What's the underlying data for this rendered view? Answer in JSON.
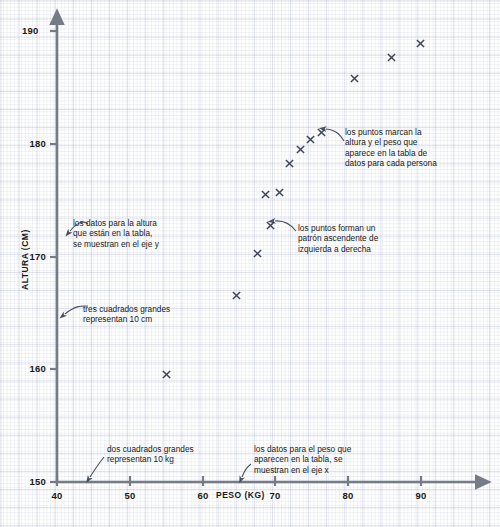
{
  "chart_data": {
    "type": "scatter",
    "title": "",
    "xlabel": "PESO (KG)",
    "ylabel": "ALTURA (CM)",
    "xlim": [
      40,
      92
    ],
    "ylim": [
      150,
      191
    ],
    "xticks": [
      40,
      50,
      60,
      70,
      80,
      90
    ],
    "yticks": [
      150,
      160,
      170,
      180,
      190
    ],
    "grid": true,
    "grid_minor_per_major": 5,
    "legend": "none",
    "marker": "x",
    "marker_color": "#3c4456",
    "points": [
      {
        "x": 55.0,
        "y": 160.0
      },
      {
        "x": 64.7,
        "y": 167.0
      },
      {
        "x": 67.6,
        "y": 170.7
      },
      {
        "x": 69.3,
        "y": 173.2
      },
      {
        "x": 68.6,
        "y": 175.9
      },
      {
        "x": 70.6,
        "y": 176.1
      },
      {
        "x": 72.0,
        "y": 178.7
      },
      {
        "x": 73.4,
        "y": 179.9
      },
      {
        "x": 74.8,
        "y": 180.8
      },
      {
        "x": 76.4,
        "y": 181.4
      },
      {
        "x": 80.9,
        "y": 186.2
      },
      {
        "x": 86.0,
        "y": 188.1
      },
      {
        "x": 89.9,
        "y": 189.3
      }
    ],
    "annotations": [
      {
        "id": "y-axis-note",
        "text": "los datos para la altura\nque están en la tabla,\nse muestran en el eje y"
      },
      {
        "id": "y-scale-note",
        "text": "tres cuadrados grandes\nrepresentan 10 cm"
      },
      {
        "id": "x-scale-note",
        "text": "dos cuadrados grandes\nrepresentan 10 kg"
      },
      {
        "id": "x-axis-note",
        "text": "los datos para el peso que\naparecen en la tabla, se\nmuestran en el eje x"
      },
      {
        "id": "points-note",
        "text": "los puntos marcan la\naltura y el peso que\naparece en la tabla de\ndatos para cada persona"
      },
      {
        "id": "trend-note",
        "text": "los puntos forman un\npatrón ascendente de\nizquierda a derecha"
      }
    ]
  },
  "axis": {
    "x_tick_labels": [
      "40",
      "50",
      "60",
      "70",
      "80",
      "90"
    ],
    "y_tick_labels": [
      "150",
      "160",
      "170",
      "180",
      "190"
    ],
    "x_title": "PESO (KG)",
    "y_title": "ALTURA (CM)"
  },
  "colors": {
    "axis": "#767c86",
    "marker": "#3c4456",
    "text": "#1a1a1a",
    "grid_minor": "#c8cfe0",
    "grid_major": "#b4bcd2"
  }
}
